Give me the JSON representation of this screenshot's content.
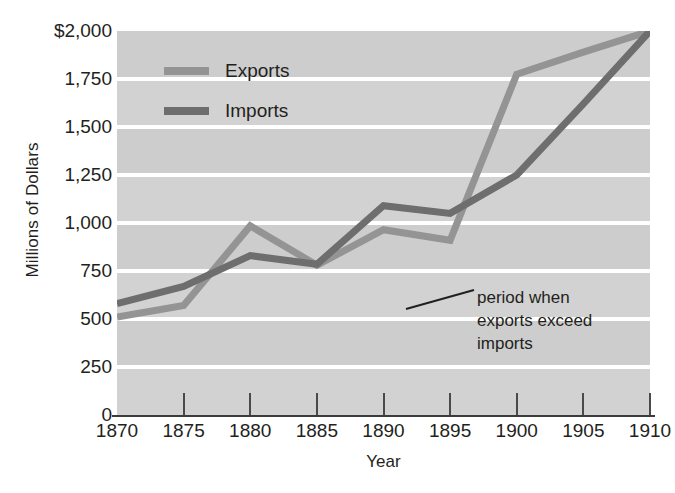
{
  "chart_data": {
    "type": "line",
    "title": "",
    "xlabel": "Year",
    "ylabel": "Millions of Dollars",
    "x": [
      1870,
      1875,
      1880,
      1885,
      1890,
      1895,
      1900,
      1905,
      1910
    ],
    "categories": [
      "1870",
      "1875",
      "1880",
      "1885",
      "1890",
      "1895",
      "1900",
      "1905",
      "1910"
    ],
    "series": [
      {
        "name": "Exports",
        "color": "#949494",
        "values": [
          510,
          570,
          985,
          780,
          965,
          910,
          1775,
          1890,
          2000
        ]
      },
      {
        "name": "Imports",
        "color": "#6e6e6e",
        "values": [
          580,
          670,
          830,
          785,
          1090,
          1050,
          1250,
          1620,
          2000
        ]
      }
    ],
    "xlim": [
      1870,
      1910
    ],
    "ylim": [
      0,
      2000
    ],
    "ytick_values": [
      0,
      250,
      500,
      750,
      1000,
      1250,
      1500,
      1750,
      2000
    ],
    "ytick_labels": [
      "0",
      "250",
      "500",
      "750",
      "1,000",
      "1,250",
      "1,500",
      "1,750",
      "$2,000"
    ],
    "xtick_labels": [
      "1870",
      "1875",
      "1880",
      "1885",
      "1890",
      "1895",
      "1900",
      "1905",
      "1910"
    ],
    "grid": true,
    "grid_color": "#ffffff",
    "plot_background": "#d2d2d2",
    "band_color": "#cdcdcd",
    "legend_position": "upper-left-inside",
    "annotations": [
      {
        "name": "exports-exceed-imports",
        "lines": [
          "period when",
          "exports exceed",
          "imports"
        ],
        "leader_line": true
      }
    ]
  },
  "legend": {
    "items": [
      {
        "label": "Exports",
        "color": "#949494"
      },
      {
        "label": "Imports",
        "color": "#6e6e6e"
      }
    ]
  },
  "axes": {
    "y_title": "Millions of Dollars",
    "x_title": "Year"
  }
}
